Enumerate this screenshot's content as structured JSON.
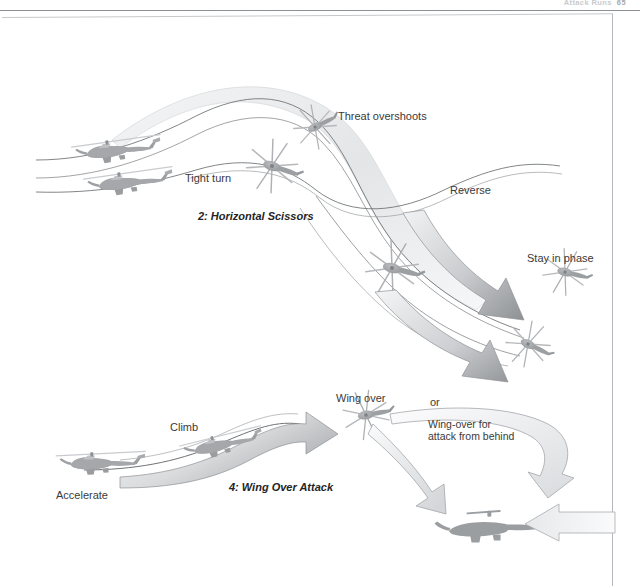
{
  "page": {
    "running_head": "Attack Runs",
    "folio": "65",
    "background": "#ffffff",
    "frame_color": "#b4b8bc",
    "rule_color": "#8d9196"
  },
  "figures": [
    {
      "id": "horizontal-scissors",
      "caption": "2: Horizontal Scissors",
      "labels": [
        {
          "id": "tight-turn",
          "text": "Tight turn"
        },
        {
          "id": "threat-overshoots",
          "text": "Threat overshoots"
        },
        {
          "id": "reverse",
          "text": "Reverse"
        },
        {
          "id": "stay-in-phase",
          "text": "Stay in phase"
        }
      ]
    },
    {
      "id": "wing-over-attack",
      "caption": "4: Wing Over Attack",
      "labels": [
        {
          "id": "accelerate",
          "text": "Accelerate"
        },
        {
          "id": "climb",
          "text": "Climb"
        },
        {
          "id": "wing-over",
          "text": "Wing over"
        },
        {
          "id": "or",
          "text": "or"
        },
        {
          "id": "wing-over-behind",
          "text": "Wing-over for\nattack from behind"
        }
      ]
    }
  ],
  "palette": {
    "helicopter_fill": "#a6a8ab",
    "helicopter_dark": "#8c8e91",
    "helicopter_silhouette": "#9b9ea1",
    "arrow_fill_light": "#e9eaec",
    "arrow_fill_mid": "#b9bbbe",
    "arrow_stroke": "#9a9da0",
    "ribbon_fill": "#eceef0",
    "path_stroke": "#6f7276"
  }
}
